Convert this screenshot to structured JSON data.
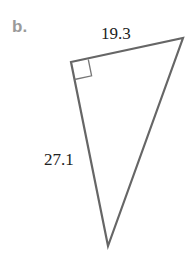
{
  "part_label": "b.",
  "figure": {
    "type": "right triangle",
    "vertices": {
      "right_angle": [
        71,
        62
      ],
      "top_right": [
        183,
        38
      ],
      "bottom": [
        108,
        246
      ]
    },
    "sides": {
      "top": "19.3",
      "left": "27.1"
    },
    "right_angle_marker": true,
    "stroke_color": "#666666",
    "label_color": "#9a9a9a"
  }
}
